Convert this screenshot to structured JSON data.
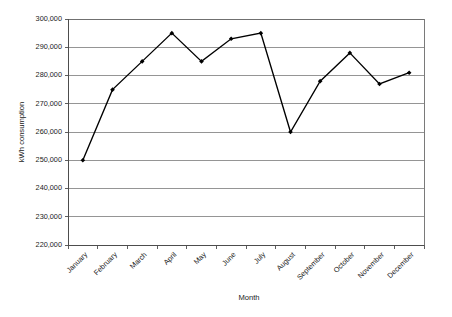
{
  "chart_data": {
    "type": "line",
    "title": "",
    "xlabel": "Month",
    "ylabel": "kWh consumption",
    "categories": [
      "January",
      "February",
      "March",
      "April",
      "May",
      "June",
      "July",
      "August",
      "September",
      "October",
      "November",
      "December"
    ],
    "values": [
      250000,
      275000,
      285000,
      295000,
      285000,
      293000,
      295000,
      260000,
      278000,
      288000,
      277000,
      281000
    ],
    "ylim": [
      220000,
      300000
    ],
    "ytick_labels": [
      "220,000",
      "230,000",
      "240,000",
      "250,000",
      "260,000",
      "270,000",
      "280,000",
      "290,000",
      "300,000"
    ],
    "ytick_values": [
      220000,
      230000,
      240000,
      250000,
      260000,
      270000,
      280000,
      290000,
      300000
    ],
    "grid": true,
    "grid_axis": "y",
    "legend": false,
    "legend_position": "none",
    "marker": "filled-diamond",
    "line_color": "#000000",
    "grid_color": "#7a7a7a",
    "background_color": "#ffffff",
    "xtick_label_rotation": -45
  },
  "axis": {
    "y_title": "kWh consumption",
    "x_title": "Month"
  }
}
